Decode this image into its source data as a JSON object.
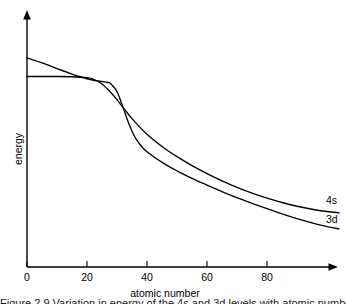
{
  "chart_data": {
    "type": "line",
    "title": "",
    "xlabel": "atomic number",
    "ylabel": "energy",
    "xlim": [
      0,
      104
    ],
    "ylim": [
      0,
      1
    ],
    "grid": false,
    "legend": "inline-end-labels",
    "xticks": [
      "0",
      "20",
      "40",
      "60",
      "80"
    ],
    "xtick_values": [
      0,
      20,
      40,
      60,
      80
    ],
    "yticks": [],
    "annotations": [
      "4s and 3d energies cross near atomic number 17 and again near atomic number 32",
      "3d begins higher in energy than 4s and ends lower in energy than 4s"
    ],
    "series": [
      {
        "name": "4s",
        "label": "4s",
        "color": "#000000",
        "x": [
          0,
          5,
          10,
          15,
          20,
          22,
          25,
          28,
          30,
          32,
          35,
          40,
          45,
          50,
          55,
          60,
          65,
          70,
          75,
          80,
          85,
          90,
          95,
          100,
          104
        ],
        "y": [
          0.765,
          0.765,
          0.765,
          0.764,
          0.76,
          0.755,
          0.735,
          0.7,
          0.672,
          0.641,
          0.596,
          0.533,
          0.484,
          0.443,
          0.407,
          0.375,
          0.346,
          0.32,
          0.297,
          0.277,
          0.259,
          0.244,
          0.232,
          0.223,
          0.218
        ]
      },
      {
        "name": "3d",
        "label": "3d",
        "color": "#000000",
        "x": [
          0,
          5,
          10,
          15,
          17,
          20,
          23,
          25,
          27,
          28,
          30,
          32,
          34,
          36,
          38,
          40,
          45,
          50,
          55,
          60,
          65,
          70,
          75,
          80,
          85,
          90,
          95,
          100,
          104
        ],
        "y": [
          0.84,
          0.82,
          0.797,
          0.775,
          0.767,
          0.756,
          0.748,
          0.745,
          0.741,
          0.735,
          0.705,
          0.641,
          0.574,
          0.521,
          0.487,
          0.463,
          0.42,
          0.386,
          0.356,
          0.329,
          0.303,
          0.279,
          0.256,
          0.234,
          0.213,
          0.194,
          0.177,
          0.162,
          0.153
        ]
      }
    ]
  },
  "figure": {
    "x_axis_label": "atomic number",
    "y_axis_label": "energy",
    "curve_label_4s": "4s",
    "curve_label_3d": "3d",
    "tick_0": "0",
    "tick_20": "20",
    "tick_40": "40",
    "tick_60": "60",
    "tick_80": "80",
    "caption_partial": "Figure 2.9  Variation in energy of the 4s and 3d levels with atomic number"
  }
}
